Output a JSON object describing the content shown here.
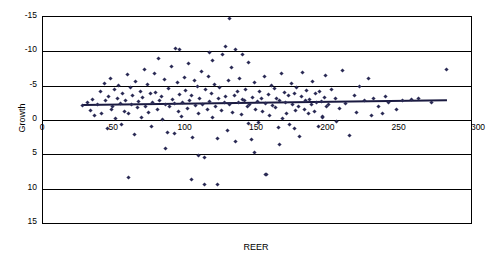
{
  "chart_data": {
    "type": "scatter",
    "title": "",
    "xlabel": "REER",
    "ylabel": "Growth",
    "xlim": [
      0,
      300
    ],
    "ylim": [
      -15,
      15
    ],
    "xticks": [
      0,
      50,
      100,
      150,
      200,
      250,
      300
    ],
    "yticks": [
      -15,
      -10,
      -5,
      0,
      5,
      10,
      15
    ],
    "grid": "horizontal",
    "legend": "none",
    "series": [
      {
        "name": "Growth vs REER",
        "marker": "diamond",
        "color": "#2b2b55",
        "points": [
          [
            28,
            2.1
          ],
          [
            31,
            2.6
          ],
          [
            33,
            1.4
          ],
          [
            35,
            3.0
          ],
          [
            36,
            0.6
          ],
          [
            38,
            2.2
          ],
          [
            40,
            4.1
          ],
          [
            41,
            1.0
          ],
          [
            43,
            5.3
          ],
          [
            44,
            2.8
          ],
          [
            45,
            -1.2
          ],
          [
            46,
            3.4
          ],
          [
            47,
            6.1
          ],
          [
            48,
            1.6
          ],
          [
            49,
            2.0
          ],
          [
            50,
            4.4
          ],
          [
            51,
            0.2
          ],
          [
            52,
            3.1
          ],
          [
            53,
            5.0
          ],
          [
            54,
            2.4
          ],
          [
            55,
            -0.6
          ],
          [
            56,
            3.8
          ],
          [
            57,
            1.2
          ],
          [
            58,
            2.9
          ],
          [
            59,
            6.6
          ],
          [
            60,
            0.9
          ],
          [
            61,
            4.8
          ],
          [
            62,
            2.2
          ],
          [
            63,
            3.6
          ],
          [
            64,
            -2.1
          ],
          [
            65,
            5.6
          ],
          [
            66,
            1.8
          ],
          [
            67,
            2.7
          ],
          [
            68,
            4.2
          ],
          [
            69,
            0.4
          ],
          [
            70,
            3.3
          ],
          [
            71,
            7.4
          ],
          [
            72,
            2.0
          ],
          [
            73,
            5.1
          ],
          [
            74,
            1.1
          ],
          [
            75,
            3.9
          ],
          [
            76,
            -0.9
          ],
          [
            77,
            2.5
          ],
          [
            78,
            6.8
          ],
          [
            79,
            4.0
          ],
          [
            80,
            1.5
          ],
          [
            81,
            8.9
          ],
          [
            82,
            2.8
          ],
          [
            83,
            3.4
          ],
          [
            84,
            0.1
          ],
          [
            85,
            5.9
          ],
          [
            86,
            2.2
          ],
          [
            87,
            -1.8
          ],
          [
            88,
            4.6
          ],
          [
            89,
            1.9
          ],
          [
            90,
            7.8
          ],
          [
            91,
            3.0
          ],
          [
            92,
            2.4
          ],
          [
            93,
            10.4
          ],
          [
            94,
            5.4
          ],
          [
            95,
            1.3
          ],
          [
            96,
            3.7
          ],
          [
            97,
            0.5
          ],
          [
            98,
            2.6
          ],
          [
            99,
            6.2
          ],
          [
            100,
            4.3
          ],
          [
            101,
            1.7
          ],
          [
            102,
            8.2
          ],
          [
            103,
            2.9
          ],
          [
            104,
            3.5
          ],
          [
            105,
            -2.6
          ],
          [
            106,
            5.7
          ],
          [
            107,
            2.1
          ],
          [
            108,
            4.9
          ],
          [
            109,
            1.0
          ],
          [
            110,
            3.2
          ],
          [
            111,
            7.1
          ],
          [
            112,
            2.3
          ],
          [
            113,
            -5.4
          ],
          [
            114,
            4.5
          ],
          [
            115,
            1.6
          ],
          [
            116,
            6.4
          ],
          [
            117,
            2.7
          ],
          [
            118,
            3.8
          ],
          [
            119,
            0.3
          ],
          [
            120,
            5.2
          ],
          [
            121,
            2.0
          ],
          [
            122,
            -9.4
          ],
          [
            123,
            3.1
          ],
          [
            124,
            4.7
          ],
          [
            125,
            1.4
          ],
          [
            126,
            9.6
          ],
          [
            127,
            2.6
          ],
          [
            128,
            3.4
          ],
          [
            129,
            -1.5
          ],
          [
            130,
            5.8
          ],
          [
            131,
            2.2
          ],
          [
            132,
            7.6
          ],
          [
            133,
            1.1
          ],
          [
            134,
            3.6
          ],
          [
            135,
            -3.2
          ],
          [
            136,
            4.1
          ],
          [
            137,
            2.5
          ],
          [
            138,
            6.0
          ],
          [
            139,
            0.8
          ],
          [
            140,
            3.0
          ],
          [
            141,
            2.8
          ],
          [
            142,
            4.4
          ],
          [
            143,
            1.9
          ],
          [
            144,
            8.4
          ],
          [
            145,
            2.3
          ],
          [
            146,
            -2.9
          ],
          [
            147,
            3.3
          ],
          [
            148,
            5.5
          ],
          [
            149,
            1.5
          ],
          [
            150,
            2.7
          ],
          [
            151,
            -0.4
          ],
          [
            152,
            4.2
          ],
          [
            153,
            3.1
          ],
          [
            154,
            1.2
          ],
          [
            155,
            6.3
          ],
          [
            156,
            2.4
          ],
          [
            157,
            -8.0
          ],
          [
            158,
            3.7
          ],
          [
            159,
            0.6
          ],
          [
            160,
            5.0
          ],
          [
            161,
            2.1
          ],
          [
            162,
            4.6
          ],
          [
            163,
            1.8
          ],
          [
            164,
            3.2
          ],
          [
            165,
            -1.1
          ],
          [
            166,
            2.9
          ],
          [
            167,
            6.7
          ],
          [
            168,
            0.2
          ],
          [
            169,
            4.0
          ],
          [
            170,
            2.6
          ],
          [
            171,
            1.0
          ],
          [
            172,
            3.5
          ],
          [
            173,
            -0.7
          ],
          [
            174,
            5.3
          ],
          [
            175,
            2.2
          ],
          [
            176,
            3.9
          ],
          [
            177,
            1.4
          ],
          [
            178,
            4.8
          ],
          [
            179,
            2.0
          ],
          [
            180,
            -2.4
          ],
          [
            181,
            3.4
          ],
          [
            182,
            6.9
          ],
          [
            183,
            1.6
          ],
          [
            184,
            2.8
          ],
          [
            185,
            4.3
          ],
          [
            186,
            0.9
          ],
          [
            187,
            3.0
          ],
          [
            188,
            2.3
          ],
          [
            189,
            5.6
          ],
          [
            190,
            1.3
          ],
          [
            191,
            3.8
          ],
          [
            192,
            2.5
          ],
          [
            193,
            -1.0
          ],
          [
            194,
            4.1
          ],
          [
            195,
            2.7
          ],
          [
            196,
            0.5
          ],
          [
            197,
            3.3
          ],
          [
            198,
            6.5
          ],
          [
            199,
            1.9
          ],
          [
            200,
            2.2
          ],
          [
            202,
            4.5
          ],
          [
            205,
            3.1
          ],
          [
            208,
            1.7
          ],
          [
            210,
            7.2
          ],
          [
            212,
            2.4
          ],
          [
            215,
            -2.2
          ],
          [
            218,
            3.6
          ],
          [
            220,
            1.1
          ],
          [
            222,
            4.9
          ],
          [
            225,
            2.8
          ],
          [
            228,
            6.1
          ],
          [
            230,
            0.7
          ],
          [
            232,
            3.2
          ],
          [
            235,
            2.0
          ],
          [
            238,
            1.0
          ],
          [
            240,
            3.4
          ],
          [
            242,
            2.6
          ],
          [
            248,
            1.5
          ],
          [
            252,
            2.9
          ],
          [
            258,
            3.0
          ],
          [
            263,
            3.2
          ],
          [
            272,
            2.5
          ],
          [
            283,
            7.4
          ],
          [
            131,
            14.8
          ],
          [
            128,
            10.7
          ],
          [
            135,
            10.2
          ],
          [
            96,
            10.3
          ],
          [
            117,
            9.8
          ],
          [
            140,
            9.5
          ],
          [
            119,
            8.6
          ],
          [
            104,
            -8.6
          ],
          [
            60,
            -8.4
          ],
          [
            156,
            -7.9
          ],
          [
            113,
            -9.4
          ],
          [
            109,
            -5.2
          ],
          [
            148,
            -4.8
          ],
          [
            86,
            -4.2
          ],
          [
            166,
            -3.6
          ],
          [
            122,
            -2.7
          ],
          [
            92,
            -1.9
          ],
          [
            176,
            -1.3
          ],
          [
            206,
            -0.2
          ],
          [
            196,
            0.3
          ],
          [
            144,
            -0.5
          ]
        ]
      }
    ],
    "trendline": {
      "name": "linear fit",
      "x_start": 28,
      "x_end": 283,
      "y_start": 2.35,
      "y_end": 3.05,
      "color": "#1a1a40"
    }
  },
  "axis": {
    "ylabel": "Growth",
    "xlabel": "REER",
    "yticks": [
      "15",
      "10",
      "5",
      "0",
      "-5",
      "-10",
      "-15"
    ],
    "xticks": [
      "0",
      "50",
      "100",
      "150",
      "200",
      "250",
      "300"
    ]
  }
}
